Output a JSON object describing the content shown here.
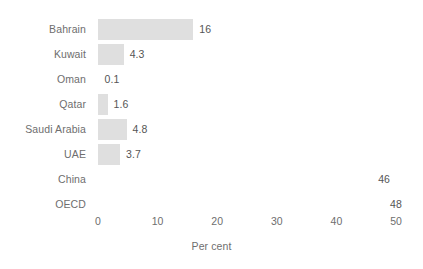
{
  "chart_data": {
    "type": "bar",
    "orientation": "horizontal",
    "title": "",
    "subtitle": "",
    "xlabel": "Per cent",
    "ylabel": "",
    "xlim": [
      0,
      50
    ],
    "xticks": [
      0,
      10,
      20,
      30,
      40,
      50
    ],
    "xtick_labels": [
      "0",
      "10",
      "20",
      "30",
      "40",
      "50"
    ],
    "grid": false,
    "legend": null,
    "categories": [
      "Bahrain",
      "Kuwait",
      "Oman",
      "Qatar",
      "Saudi Arabia",
      "UAE",
      "China",
      "OECD"
    ],
    "values": [
      16,
      4.3,
      0.1,
      1.6,
      4.8,
      3.7,
      46,
      48
    ],
    "value_labels": [
      "16",
      "4.3",
      "0.1",
      "1.6",
      "4.8",
      "3.7",
      "46",
      "48"
    ],
    "bars_drawn": [
      true,
      true,
      false,
      true,
      true,
      true,
      false,
      false
    ],
    "bar_color": "#dfdfdf",
    "label_color": "#6e6e6e",
    "value_color": "#555555",
    "background": "#ffffff"
  },
  "axis": {
    "title": "Per cent"
  },
  "rows": [
    {
      "label": "Bahrain",
      "value_label": "16"
    },
    {
      "label": "Kuwait",
      "value_label": "4.3"
    },
    {
      "label": "Oman",
      "value_label": "0.1"
    },
    {
      "label": "Qatar",
      "value_label": "1.6"
    },
    {
      "label": "Saudi Arabia",
      "value_label": "4.8"
    },
    {
      "label": "UAE",
      "value_label": "3.7"
    },
    {
      "label": "China",
      "value_label": "46"
    },
    {
      "label": "OECD",
      "value_label": "48"
    }
  ],
  "ticks": [
    {
      "label": "0"
    },
    {
      "label": "10"
    },
    {
      "label": "20"
    },
    {
      "label": "30"
    },
    {
      "label": "40"
    },
    {
      "label": "50"
    }
  ]
}
